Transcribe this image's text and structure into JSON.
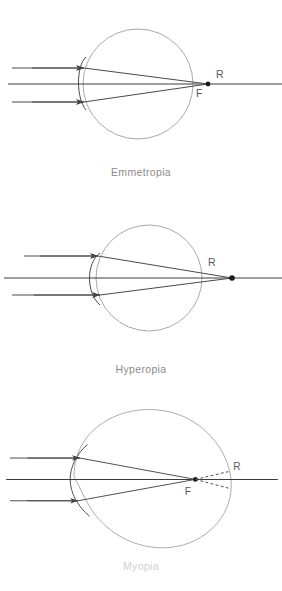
{
  "figure": {
    "stroke_colors": {
      "eye_outline": "#a9a9a9",
      "ray": "#4a4a4a",
      "axis": "#3c3c3c",
      "focal_point": "#1a1a1a",
      "caption_text": "#8c8c8c"
    }
  },
  "panels": [
    {
      "id": "emmetropia",
      "caption": "Emmetropia",
      "point_labels": {
        "retina": "R",
        "focus": "F"
      },
      "description": "Parallel rays focus exactly on the retina; R and F coincide.",
      "eye_shape": "round",
      "focus_position": "on-retina",
      "rays": 3,
      "arrowheads": 2,
      "dashed_rays": 0
    },
    {
      "id": "hyperopia",
      "caption": "Hyperopia",
      "point_labels": {
        "retina": "R"
      },
      "description": "Short eye; parallel rays converge behind the retina at R.",
      "eye_shape": "short-round",
      "focus_position": "behind-retina",
      "rays": 3,
      "arrowheads": 2,
      "dashed_rays": 0
    },
    {
      "id": "myopia",
      "caption": "Myopia",
      "point_labels": {
        "retina": "R",
        "focus": "F"
      },
      "description": "Elongated eye; rays focus at F in front of the retina, then diverge to R.",
      "eye_shape": "elongated-oval",
      "focus_position": "in-front-of-retina",
      "rays": 3,
      "arrowheads": 2,
      "dashed_rays": 2
    }
  ]
}
